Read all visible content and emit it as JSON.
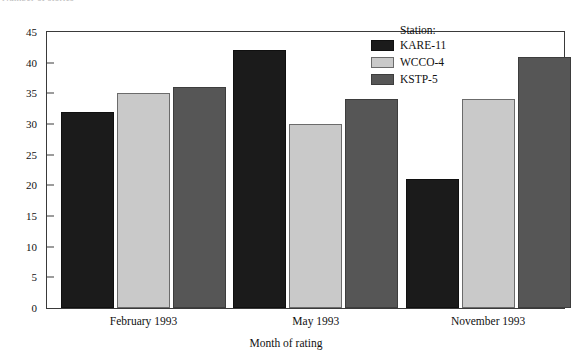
{
  "clipped_title": "Number of stories",
  "chart_data": {
    "type": "bar",
    "title": "",
    "xlabel": "Month of rating",
    "ylabel": "",
    "categories": [
      "February 1993",
      "May 1993",
      "November 1993"
    ],
    "series": [
      {
        "name": "KARE-11",
        "color": "#1b1b1b",
        "values": [
          32,
          42,
          21
        ]
      },
      {
        "name": "WCCO-4",
        "color": "#c9c9c9",
        "values": [
          35,
          30,
          34
        ]
      },
      {
        "name": "KSTP-5",
        "color": "#565656",
        "values": [
          36,
          34,
          41
        ]
      }
    ],
    "ylim": [
      0,
      45
    ],
    "yticks": [
      0,
      5,
      10,
      15,
      20,
      25,
      30,
      35,
      40,
      45
    ],
    "ytick_labels": [
      "0",
      "5",
      "10",
      "15",
      "20",
      "25",
      "30",
      "35",
      "40",
      "45"
    ],
    "grid": false,
    "legend_position": "top-right",
    "legend_title": "Station:"
  }
}
